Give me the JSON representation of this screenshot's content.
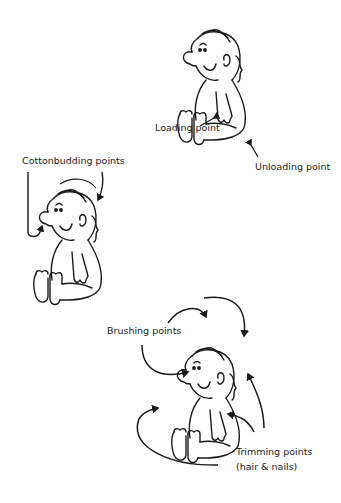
{
  "figure": {
    "panels": [
      {
        "name": "loading-unloading",
        "labels": [
          "Loading point",
          "Unloading point"
        ]
      },
      {
        "name": "cottonbudding",
        "labels": [
          "Cottonbudding points"
        ]
      },
      {
        "name": "brushing-trimming",
        "labels": [
          "Brushing points",
          "Trimming points",
          "(hair & nails)"
        ]
      }
    ]
  },
  "labels": {
    "loading": "Loading point",
    "unloading": "Unloading point",
    "cottonbudding": "Cottonbudding points",
    "brushing": "Brushing points",
    "trimming_1": "Trimming points",
    "trimming_2": "(hair & nails)"
  },
  "colors": {
    "ink": "#1a1a1a",
    "background": "#ffffff"
  }
}
